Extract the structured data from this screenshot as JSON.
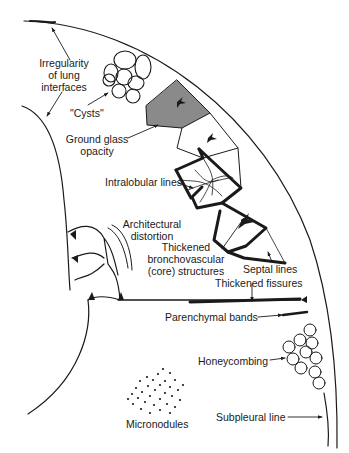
{
  "diagram": {
    "type": "schematic illustration of lung CT findings",
    "labels": {
      "irregularity": [
        "Irregularity",
        "of lung",
        "interfaces"
      ],
      "cysts": "\"Cysts\"",
      "ground_glass": [
        "Ground glass",
        "opacity"
      ],
      "intralobular": "Intralobular lines",
      "architectural": [
        "Architectural",
        "distortion"
      ],
      "bronchovascular": [
        "Thickened",
        "bronchovascular",
        "(core) structures"
      ],
      "septal": "Septal lines",
      "fissures": "Thickened fissures",
      "parenchymal": "Parenchymal bands",
      "honeycombing": "Honeycombing",
      "micronodules": "Micronodules",
      "subpleural": "Subpleural line"
    },
    "colors": {
      "ink": "#1a1a1a",
      "ground_glass_fill": "#8a8a8a",
      "background": "#ffffff"
    }
  }
}
